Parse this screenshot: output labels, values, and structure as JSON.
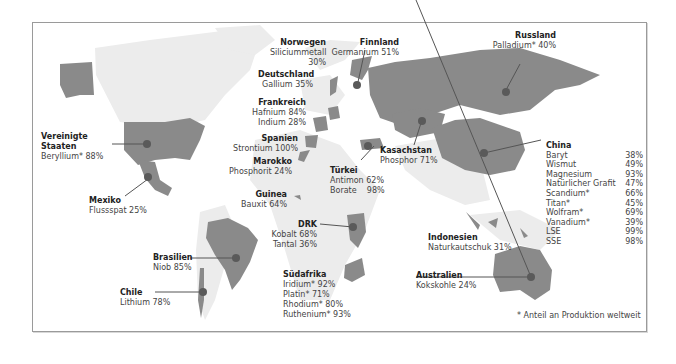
{
  "colors": {
    "highlight_country": "#8a8a8a",
    "other_land": "#ececec",
    "marker": "#5a5a5a",
    "leader_line": "#555555",
    "frame_border": "#9a9a9a",
    "text": "#444444"
  },
  "countries": {
    "usa": {
      "name": "Vereinigte Staaten",
      "name_line1": "Vereinigte",
      "name_line2": "Staaten",
      "items": [
        {
          "label": "Beryllium*",
          "value": "88%"
        }
      ],
      "text": "Beryllium*  88%"
    },
    "mexico": {
      "name": "Mexiko",
      "items": [
        {
          "label": "Flussspat",
          "value": "25%"
        }
      ],
      "text": "Flussspat 25%"
    },
    "brazil": {
      "name": "Brasilien",
      "items": [
        {
          "label": "Niob",
          "value": "85%"
        }
      ],
      "text": "Niob 85%"
    },
    "chile": {
      "name": "Chile",
      "items": [
        {
          "label": "Lithium",
          "value": "78%"
        }
      ],
      "text": "Lithium 78%"
    },
    "norway": {
      "name": "Norwegen",
      "items": [
        {
          "label": "Siliciummetall",
          "value": "30%"
        }
      ],
      "line1": "Siliciummetall",
      "line2": "30%"
    },
    "germany": {
      "name": "Deutschland",
      "items": [
        {
          "label": "Gallium",
          "value": "35%"
        }
      ],
      "text": "Gallium 35%"
    },
    "france": {
      "name": "Frankreich",
      "items": [
        {
          "label": "Hafnium",
          "value": "84%"
        },
        {
          "label": "Indium",
          "value": "28%"
        }
      ],
      "line1": "Hafnium 84%",
      "line2": "Indium 28%"
    },
    "spain": {
      "name": "Spanien",
      "items": [
        {
          "label": "Strontium",
          "value": "100%"
        }
      ],
      "text": "Strontium 100%"
    },
    "morocco": {
      "name": "Marokko",
      "items": [
        {
          "label": "Phosphorit",
          "value": "24%"
        }
      ],
      "text": "Phosphorit 24%"
    },
    "guinea": {
      "name": "Guinea",
      "items": [
        {
          "label": "Bauxit",
          "value": "64%"
        }
      ],
      "text": "Bauxit 64%"
    },
    "finland": {
      "name": "Finnland",
      "items": [
        {
          "label": "Germanium",
          "value": "51%"
        }
      ],
      "text": "Germanium 51%"
    },
    "russia": {
      "name": "Russland",
      "items": [
        {
          "label": "Palladium*",
          "value": "40%"
        }
      ],
      "text": "Palladium* 40%"
    },
    "kazakhstan": {
      "name": "Kasachstan",
      "items": [
        {
          "label": "Phosphor",
          "value": "71%"
        }
      ],
      "text": "Phosphor 71%"
    },
    "turkey": {
      "name": "Türkei",
      "items": [
        {
          "label": "Antimon",
          "value": "62%"
        },
        {
          "label": "Borate",
          "value": "98%"
        }
      ],
      "line1": "Antimon 62%",
      "line2": "Borate    98%"
    },
    "drc": {
      "name": "DRK",
      "items": [
        {
          "label": "Kobalt",
          "value": "68%"
        },
        {
          "label": "Tantal",
          "value": "36%"
        }
      ],
      "line1": "Kobalt 68%",
      "line2": "Tantal 36%"
    },
    "south_africa": {
      "name": "Südafrika",
      "items": [
        {
          "label": "Iridium*",
          "value": "92%"
        },
        {
          "label": "Platin*",
          "value": "71%"
        },
        {
          "label": "Rhodium*",
          "value": "80%"
        },
        {
          "label": "Ruthenium*",
          "value": "93%"
        }
      ],
      "line1": "Iridium* 92%",
      "line2": "Platin* 71%",
      "line3": "Rhodium* 80%",
      "line4": "Ruthenium* 93%"
    },
    "indonesia": {
      "name": "Indonesien",
      "items": [
        {
          "label": "Naturkautschuk",
          "value": "31%"
        }
      ],
      "text": "Naturkautschuk 31%"
    },
    "australia": {
      "name": "Australien",
      "items": [
        {
          "label": "Kokskohle",
          "value": "24%"
        }
      ],
      "text": "Kokskohle 24%"
    },
    "china": {
      "name": "China",
      "items": [
        {
          "label": "Baryt",
          "value": "38%"
        },
        {
          "label": "Wismut",
          "value": "49%"
        },
        {
          "label": "Magnesium",
          "value": "93%"
        },
        {
          "label": "Natürlicher Grafit",
          "value": "47%"
        },
        {
          "label": "Scandium*",
          "value": "66%"
        },
        {
          "label": "Titan*",
          "value": "45%"
        },
        {
          "label": "Wolfram*",
          "value": "69%"
        },
        {
          "label": "Vanadium*",
          "value": "39%"
        },
        {
          "label": "LSE",
          "value": "99%"
        },
        {
          "label": "SSE",
          "value": "98%"
        }
      ]
    }
  },
  "footnote": "* Anteil an Produktion weltweit"
}
